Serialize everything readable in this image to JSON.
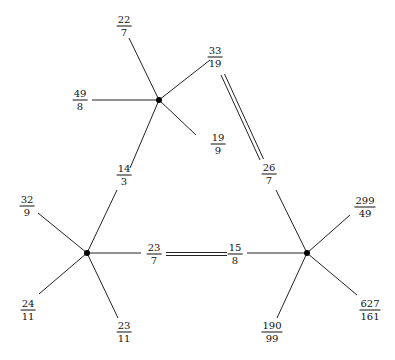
{
  "diagram": {
    "type": "graph",
    "nodes": [
      {
        "id": "top",
        "x": 159,
        "y": 100
      },
      {
        "id": "left",
        "x": 87,
        "y": 253
      },
      {
        "id": "right",
        "x": 307,
        "y": 253
      }
    ],
    "labels": [
      {
        "num": "22",
        "den": "7",
        "x": 124,
        "y": 26
      },
      {
        "num": "33",
        "den": "19",
        "x": 215,
        "y": 57
      },
      {
        "num": "49",
        "den": "8",
        "x": 80,
        "y": 100
      },
      {
        "num": "19",
        "den": "9",
        "x": 218,
        "y": 144
      },
      {
        "num": "14",
        "den": "3",
        "x": 124,
        "y": 175
      },
      {
        "num": "26",
        "den": "7",
        "x": 269,
        "y": 174
      },
      {
        "num": "32",
        "den": "9",
        "x": 27,
        "y": 206
      },
      {
        "num": "24",
        "den": "11",
        "x": 28,
        "y": 310
      },
      {
        "num": "23",
        "den": "11",
        "x": 124,
        "y": 332
      },
      {
        "num": "23",
        "den": "7",
        "x": 154,
        "y": 254
      },
      {
        "num": "15",
        "den": "8",
        "x": 235,
        "y": 254
      },
      {
        "num": "299",
        "den": "49",
        "x": 365,
        "y": 207
      },
      {
        "num": "627",
        "den": "161",
        "x": 370,
        "y": 310
      },
      {
        "num": "190",
        "den": "99",
        "x": 272,
        "y": 332
      }
    ]
  }
}
